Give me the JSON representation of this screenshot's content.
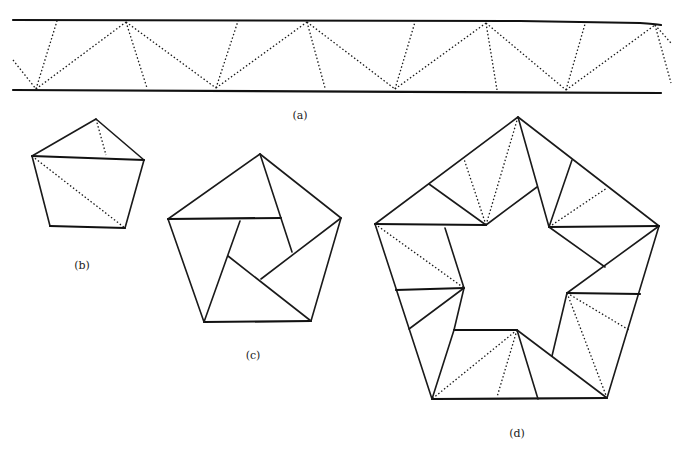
{
  "figure": {
    "panels": [
      {
        "id": "a",
        "label": "(a)",
        "description": "Strip of paper between two parallel lines with dotted zigzag fold lines"
      },
      {
        "id": "b",
        "label": "(b)",
        "description": "Single pentagon with one solid diagonal and two dotted fold lines"
      },
      {
        "id": "c",
        "label": "(c)",
        "description": "Pentagon subdivided into pinwheel arrangement with central pentagon"
      },
      {
        "id": "d",
        "label": "(d)",
        "description": "Large pentagon ring with star-shaped hole and dotted fold lines"
      }
    ]
  },
  "labels": {
    "a": "(a)",
    "b": "(b)",
    "c": "(c)",
    "d": "(d)"
  },
  "colors": {
    "ink": "#1a1a1a",
    "background": "#ffffff"
  }
}
